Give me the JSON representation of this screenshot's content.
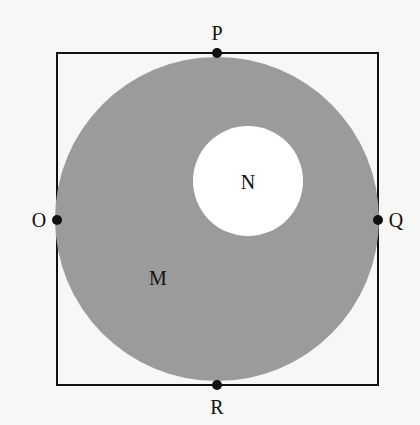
{
  "diagram": {
    "colors": {
      "background": "#f7f7f5",
      "shaded_region": "#9b9b9b",
      "inner_circle": "#ffffff",
      "lines": "#111111"
    },
    "square": {
      "x": 57,
      "y": 53,
      "width": 321,
      "height": 332
    },
    "outer_circle": {
      "cx": 217,
      "cy": 219,
      "r": 162,
      "label": "M"
    },
    "inner_circle": {
      "cx": 248,
      "cy": 181,
      "r": 55,
      "label": "N"
    },
    "points": [
      {
        "name": "P",
        "x": 217,
        "y": 53,
        "label_x": 217,
        "label_y": 40
      },
      {
        "name": "Q",
        "x": 378,
        "y": 220,
        "label_x": 396,
        "label_y": 227
      },
      {
        "name": "R",
        "x": 217,
        "y": 385,
        "label_x": 217,
        "label_y": 414
      },
      {
        "name": "O",
        "x": 57,
        "y": 220,
        "label_x": 39,
        "label_y": 227
      }
    ],
    "labels": {
      "M": {
        "text": "M",
        "x": 158,
        "y": 285
      },
      "N": {
        "text": "N",
        "x": 248,
        "y": 189
      }
    }
  }
}
